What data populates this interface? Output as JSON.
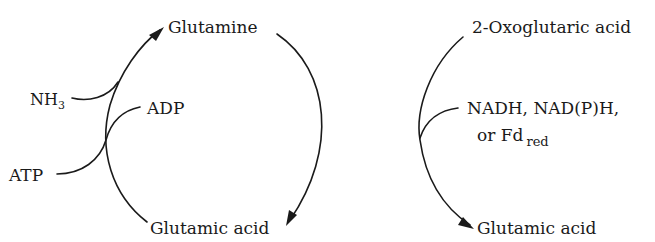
{
  "diagram": {
    "left_cycle": {
      "name": "Glutamine synthetase reaction",
      "top_node": "Glutamine",
      "bottom_node": "Glutamic acid",
      "inputs": [
        {
          "label": "NH",
          "sub": "3"
        },
        {
          "label": "ATP",
          "sub": ""
        }
      ],
      "outputs": [
        {
          "label": "ADP",
          "sub": ""
        }
      ]
    },
    "right_pathway": {
      "name": "Glutamate synthase reaction",
      "top_node": "2-Oxoglutaric acid",
      "bottom_node": "Glutamic acid",
      "cofactor_line1": "NADH, NAD(P)H,",
      "cofactor_line2_prefix": "or Fd",
      "cofactor_line2_sub": "red"
    }
  },
  "colors": {
    "ink": "#1a1a1a",
    "background": "#ffffff"
  }
}
